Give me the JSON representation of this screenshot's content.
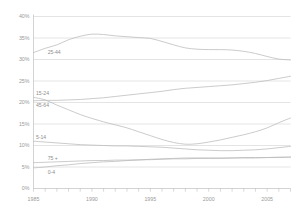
{
  "chart_data": {
    "type": "line",
    "title": "",
    "xlabel": "",
    "ylabel": "",
    "xlim": [
      1985,
      2007
    ],
    "ylim": [
      0,
      40
    ],
    "grid": true,
    "legend_position": "inline-left-of-series",
    "x": [
      1985,
      1986,
      1987,
      1988,
      1989,
      1990,
      1991,
      1992,
      1993,
      1994,
      1995,
      1996,
      1997,
      1998,
      1999,
      2000,
      2001,
      2002,
      2003,
      2004,
      2005,
      2006,
      2007
    ],
    "x_tick_labels": [
      "1985",
      "1990",
      "1995",
      "2000",
      "2005"
    ],
    "x_tick_values": [
      1985,
      1990,
      1995,
      2000,
      2005
    ],
    "y_tick_labels": [
      "0%",
      "5%",
      "10%",
      "15%",
      "20%",
      "25%",
      "30%",
      "35%",
      "40%"
    ],
    "y_tick_values": [
      0,
      5,
      10,
      15,
      20,
      25,
      30,
      35,
      40
    ],
    "series": [
      {
        "name": "25-44",
        "label": "25-44",
        "color": "#b9b9b9",
        "values": [
          31.6,
          32.6,
          33.4,
          34.6,
          35.4,
          35.9,
          35.8,
          35.5,
          35.3,
          35.1,
          34.9,
          34.2,
          33.4,
          32.7,
          32.4,
          32.3,
          32.3,
          32.2,
          31.9,
          31.4,
          30.7,
          30.1,
          29.9
        ]
      },
      {
        "name": "15-24",
        "label": "15-24",
        "color": "#b9b9b9",
        "values": [
          21.2,
          20.6,
          19.4,
          18.3,
          17.2,
          16.3,
          15.5,
          14.8,
          14.1,
          13.2,
          12.3,
          11.4,
          10.7,
          10.3,
          10.4,
          10.8,
          11.3,
          11.9,
          12.5,
          13.2,
          14.1,
          15.3,
          16.4
        ]
      },
      {
        "name": "45-64",
        "label": "45-64",
        "color": "#b9b9b9",
        "values": [
          20.4,
          20.5,
          20.5,
          20.6,
          20.7,
          20.9,
          21.1,
          21.4,
          21.7,
          22.0,
          22.3,
          22.6,
          23.0,
          23.3,
          23.5,
          23.7,
          23.9,
          24.1,
          24.4,
          24.7,
          25.1,
          25.6,
          26.1
        ]
      },
      {
        "name": "5-14",
        "label": "5-14",
        "color": "#b9b9b9",
        "values": [
          11.0,
          10.8,
          10.6,
          10.4,
          10.2,
          10.1,
          10.0,
          9.9,
          9.9,
          9.8,
          9.7,
          9.6,
          9.4,
          9.2,
          9.0,
          8.9,
          8.8,
          8.8,
          8.9,
          9.0,
          9.2,
          9.5,
          9.8
        ]
      },
      {
        "name": "75 +",
        "label": "75 +",
        "color": "#b9b9b9",
        "values": [
          6.0,
          6.1,
          6.2,
          6.3,
          6.4,
          6.5,
          6.5,
          6.6,
          6.6,
          6.7,
          6.7,
          6.8,
          6.9,
          6.9,
          7.0,
          7.0,
          7.0,
          7.1,
          7.1,
          7.1,
          7.2,
          7.2,
          7.3
        ]
      },
      {
        "name": "0-4",
        "label": "0-4",
        "color": "#b9b9b9",
        "values": [
          4.8,
          5.0,
          5.3,
          5.5,
          5.8,
          6.0,
          6.2,
          6.3,
          6.5,
          6.6,
          6.8,
          6.9,
          7.0,
          7.1,
          7.1,
          7.1,
          7.1,
          7.1,
          7.2,
          7.2,
          7.2,
          7.3,
          7.3
        ]
      }
    ]
  }
}
